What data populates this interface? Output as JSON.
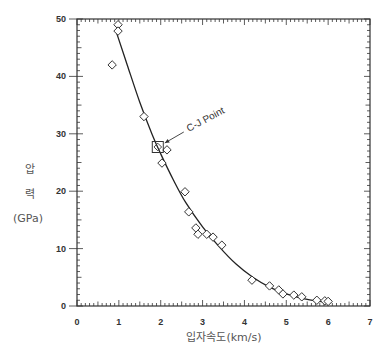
{
  "chart_data": {
    "type": "scatter",
    "title": "",
    "xlabel": "입자속도(km/s)",
    "ylabel": [
      "압",
      "력",
      "(GPa)"
    ],
    "xlim": [
      0,
      7
    ],
    "ylim": [
      0,
      50
    ],
    "x_ticks": [
      0,
      1,
      2,
      3,
      4,
      5,
      6,
      7
    ],
    "y_ticks": [
      0,
      10,
      20,
      30,
      40,
      50
    ],
    "grid": false,
    "legend": null,
    "series": [
      {
        "name": "measured",
        "marker": "diamond",
        "points": [
          [
            0.98,
            49.0
          ],
          [
            0.98,
            47.9
          ],
          [
            0.84,
            42.0
          ],
          [
            1.6,
            33.0
          ],
          [
            2.15,
            27.2
          ],
          [
            2.03,
            24.9
          ],
          [
            2.58,
            19.9
          ],
          [
            2.67,
            16.4
          ],
          [
            2.84,
            13.6
          ],
          [
            2.89,
            12.5
          ],
          [
            3.1,
            12.5
          ],
          [
            3.25,
            12.0
          ],
          [
            3.46,
            10.6
          ],
          [
            4.18,
            4.5
          ],
          [
            4.6,
            3.5
          ],
          [
            4.82,
            2.8
          ],
          [
            4.92,
            2.1
          ],
          [
            5.18,
            1.9
          ],
          [
            5.37,
            1.6
          ],
          [
            5.73,
            1.0
          ],
          [
            5.92,
            0.9
          ],
          [
            6.0,
            0.8
          ]
        ]
      },
      {
        "name": "fit",
        "line": true,
        "points": [
          [
            0.95,
            47.5
          ],
          [
            1.2,
            42.0
          ],
          [
            1.5,
            35.5
          ],
          [
            1.8,
            29.8
          ],
          [
            2.0,
            26.5
          ],
          [
            2.3,
            22.0
          ],
          [
            2.6,
            18.0
          ],
          [
            3.0,
            13.8
          ],
          [
            3.4,
            10.3
          ],
          [
            3.8,
            7.3
          ],
          [
            4.2,
            5.0
          ],
          [
            4.6,
            3.3
          ],
          [
            5.0,
            2.1
          ],
          [
            5.4,
            1.3
          ],
          [
            5.8,
            0.8
          ],
          [
            6.05,
            0.6
          ]
        ]
      }
    ],
    "annotations": [
      {
        "text": "C-J Point",
        "x": 1.93,
        "y": 27.7,
        "marker": "square"
      }
    ]
  }
}
